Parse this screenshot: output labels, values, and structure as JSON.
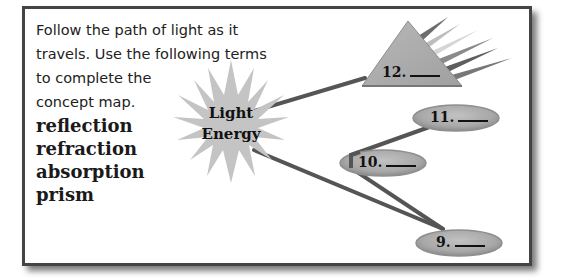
{
  "instructions": {
    "lines": [
      "Follow the path of light as it",
      "travels. Use the following terms",
      "to complete the",
      "concept map."
    ]
  },
  "terms": [
    "reflection",
    "refraction",
    "absorption",
    "prism"
  ],
  "center_node": {
    "shape": "starburst",
    "line1": "Light",
    "line2": "Energy"
  },
  "nodes": [
    {
      "shape": "triangle",
      "label": "12.",
      "blank": "____"
    },
    {
      "shape": "ellipse",
      "label": "11.",
      "blank": "____"
    },
    {
      "shape": "ellipse",
      "label": "10.",
      "blank": "____"
    },
    {
      "shape": "ellipse",
      "label": "9.",
      "blank": "____"
    }
  ],
  "colors": {
    "frame_border": "#444444",
    "node_fill": "#a9a9a9",
    "star_fill": "#c4c4c4",
    "connector": "#555555"
  }
}
